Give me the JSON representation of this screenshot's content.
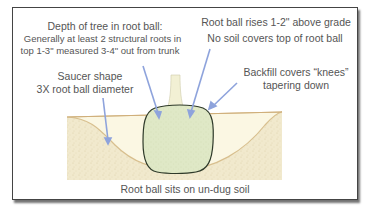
{
  "diagram": {
    "type": "tree-planting-cross-section",
    "colors": {
      "frame_border": "#444444",
      "arrow": "#8ea3dc",
      "soil_fill": "#efe6c8",
      "backfill_fill": "#fbf7e2",
      "grade_line": "#d6b98a",
      "root_ball_fill": "#dfe8c4",
      "root_ball_outline": "#2f3a2a",
      "trunk_fill": "#f3f1d6",
      "text": "#555555"
    },
    "labels": {
      "depth_title": "Depth of tree in root ball:",
      "depth_line1": "Generally at least 2 structural roots in",
      "depth_line2": "top 1-3\" measured 3-4\" out from trunk",
      "rises": "Root ball rises 1-2\" above grade",
      "no_soil": "No soil covers top of root ball",
      "saucer_line1": "Saucer shape",
      "saucer_line2": "3X root ball diameter",
      "backfill_line1": "Backfill covers “knees”",
      "backfill_line2": "tapering down",
      "bottom": "Root ball sits on un-dug soil"
    }
  }
}
